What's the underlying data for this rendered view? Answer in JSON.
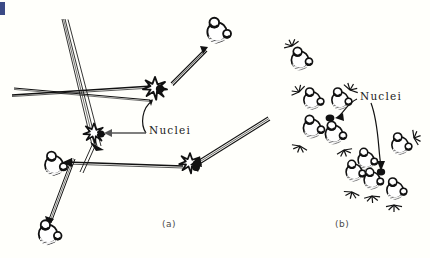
{
  "figure": {
    "background_color": "#fffffb",
    "ink_color": "#141414",
    "artifact_color": "#3b4a86",
    "width": 430,
    "height": 258
  },
  "panels": [
    {
      "id": "a",
      "caption": "(a)",
      "label": "Nuclei",
      "description": "Charged particle tracks striking nuclei, producing star-burst collisions and recoiling molecules"
    },
    {
      "id": "b",
      "caption": "(b)",
      "label": "Nuclei",
      "description": "Displaced molecules scattering away from struck nuclei with radiating impact lines"
    }
  ],
  "labels": {
    "nuclei_a": "Nuclei",
    "nuclei_b": "Nuclei",
    "caption_a": "(a)",
    "caption_b": "(b)"
  }
}
